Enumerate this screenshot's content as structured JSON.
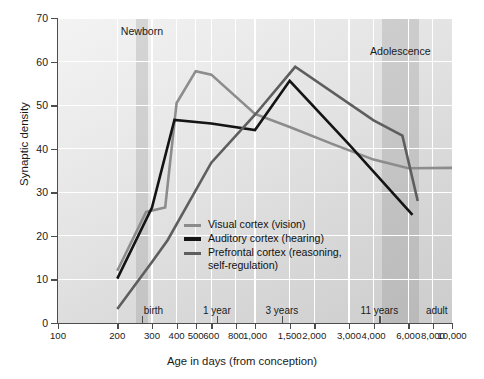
{
  "chart_data": {
    "type": "line",
    "title": "",
    "xlabel": "Age in days (from conception)",
    "ylabel": "Synaptic density",
    "xscale": "log",
    "xlim": [
      100,
      10000
    ],
    "ylim": [
      0,
      70
    ],
    "grid": true,
    "legend_position": "center-left-inside",
    "x_tick_values": [
      100,
      200,
      300,
      400,
      500,
      600,
      800,
      1000,
      1500,
      2000,
      3000,
      4000,
      6000,
      8000,
      10000
    ],
    "x_tick_labels": [
      "100",
      "200",
      "300",
      "400",
      "500",
      "600",
      "800",
      "1,000",
      "1,500",
      "2,000",
      "3,000",
      "4,000",
      "6,000",
      "8,000",
      "10,000"
    ],
    "y_tick_values": [
      0,
      10,
      20,
      30,
      40,
      50,
      60,
      70
    ],
    "y_tick_labels": [
      "0",
      "10",
      "20",
      "30",
      "40",
      "50",
      "60",
      "70"
    ],
    "series": [
      {
        "name": "Visual cortex (vision)",
        "color": "#8c8c8c",
        "width": 2.6,
        "points": [
          [
            200,
            12.0
          ],
          [
            280,
            25.5
          ],
          [
            350,
            26.5
          ],
          [
            400,
            50.5
          ],
          [
            500,
            57.8
          ],
          [
            600,
            57.0
          ],
          [
            1000,
            48.0
          ],
          [
            1500,
            45.0
          ],
          [
            2500,
            41.0
          ],
          [
            4000,
            37.5
          ],
          [
            6000,
            35.5
          ],
          [
            10000,
            35.6
          ]
        ]
      },
      {
        "name": "Auditory cortex (hearing)",
        "color": "#141414",
        "width": 2.6,
        "points": [
          [
            200,
            10.2
          ],
          [
            300,
            26.5
          ],
          [
            390,
            46.6
          ],
          [
            600,
            45.8
          ],
          [
            1000,
            44.3
          ],
          [
            1500,
            55.6
          ],
          [
            3000,
            41.0
          ],
          [
            6300,
            24.8
          ]
        ]
      },
      {
        "name": "Prefrontal cortex (reasoning,\nself-regulation)",
        "color": "#5e5e5e",
        "width": 2.6,
        "points": [
          [
            200,
            3.2
          ],
          [
            300,
            14.0
          ],
          [
            360,
            19.0
          ],
          [
            600,
            36.8
          ],
          [
            1000,
            47.8
          ],
          [
            1600,
            58.8
          ],
          [
            4000,
            46.5
          ],
          [
            5600,
            43.0
          ],
          [
            6700,
            28.0
          ]
        ]
      }
    ],
    "annotations": {
      "bands": [
        {
          "label": "Newborn",
          "bottom_label": "birth",
          "x_start": 250,
          "x_end": 285
        },
        {
          "label": "Adolescence",
          "bottom_label": "11 years",
          "x_start": 4400,
          "x_end": 6800
        }
      ],
      "bottom_markers": [
        {
          "label": "birth",
          "x": 266
        },
        {
          "label": "1 year",
          "x": 640
        },
        {
          "label": "3 years",
          "x": 1370
        },
        {
          "label": "11 years",
          "x": 4280
        },
        {
          "label": "adult",
          "x": 9500
        }
      ],
      "bottom_ticks": [
        266,
        640,
        1370,
        4280
      ]
    }
  }
}
